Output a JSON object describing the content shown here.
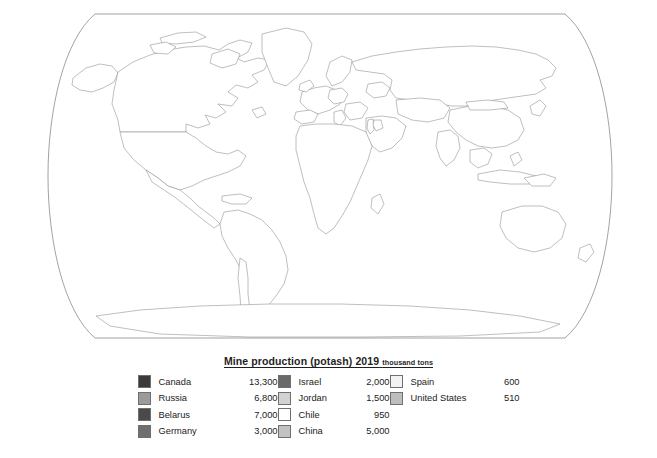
{
  "legend": {
    "title_main": "Mine production (potash) 2019",
    "title_unit": "thousand tons",
    "columns": [
      {
        "entries": [
          {
            "name": "Canada",
            "value": "13,300",
            "color": "#3a3a3a"
          },
          {
            "name": "Russia",
            "value": "6,800",
            "color": "#9b9b9b"
          },
          {
            "name": "Belarus",
            "value": "7,000",
            "color": "#4a4a4a"
          },
          {
            "name": "Germany",
            "value": "3,000",
            "color": "#6f6f6f"
          }
        ]
      },
      {
        "entries": [
          {
            "name": "Israel",
            "value": "2,000",
            "color": "#6a6a6a"
          },
          {
            "name": "Jordan",
            "value": "1,500",
            "color": "#d2d2d2"
          },
          {
            "name": "Chile",
            "value": "950",
            "color": "#ffffff"
          },
          {
            "name": "China",
            "value": "5,000",
            "color": "#c2c2c2"
          }
        ]
      },
      {
        "entries": [
          {
            "name": "Spain",
            "value": "600",
            "color": "#f2f2f2"
          },
          {
            "name": "United States",
            "value": "510",
            "color": "#bdbdbd"
          }
        ]
      }
    ]
  },
  "map": {
    "projection": "robinson-world",
    "background": "#ffffff",
    "outline_color": "#8a8a8a",
    "default_land_fill": "#ffffff",
    "regions": [
      {
        "name": "Canada",
        "fill": "#3a3a3a"
      },
      {
        "name": "United States",
        "fill": "#bdbdbd"
      },
      {
        "name": "Russia",
        "fill": "#9b9b9b"
      },
      {
        "name": "Belarus",
        "fill": "#4a4a4a"
      },
      {
        "name": "Germany",
        "fill": "#6f6f6f"
      },
      {
        "name": "China",
        "fill": "#c2c2c2"
      },
      {
        "name": "Israel",
        "fill": "#6a6a6a"
      },
      {
        "name": "Jordan",
        "fill": "#d2d2d2"
      },
      {
        "name": "Spain",
        "fill": "#f2f2f2"
      },
      {
        "name": "Chile",
        "fill": "#ffffff"
      }
    ]
  }
}
